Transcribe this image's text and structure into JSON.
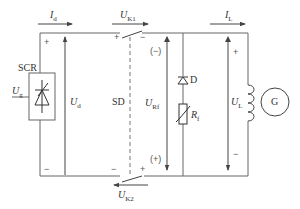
{
  "diagram": {
    "type": "circuit",
    "components": {
      "scr": {
        "label": "SCR",
        "control_voltage": "U",
        "control_voltage_sub": "g"
      },
      "switch_k1": {
        "voltage": "U",
        "voltage_sub": "K1"
      },
      "switch_k2": {
        "voltage": "U",
        "voltage_sub": "K2"
      },
      "switch_device": {
        "label": "SD"
      },
      "diode": {
        "label": "D"
      },
      "resistor": {
        "label": "R",
        "label_sub": "f"
      },
      "generator": {
        "label": "G"
      }
    },
    "currents": {
      "id": {
        "sym": "I",
        "sub": "d"
      },
      "il": {
        "sym": "I",
        "sub": "L"
      }
    },
    "voltages": {
      "ud": {
        "sym": "U",
        "sub": "d"
      },
      "urf": {
        "sym": "U",
        "sub": "Rf"
      },
      "ul": {
        "sym": "U",
        "sub": "L"
      }
    },
    "polarity": {
      "plus": "+",
      "minus": "−",
      "paren_minus": "(−)",
      "paren_plus": "(+)"
    },
    "colors": {
      "line": "#555555",
      "text": "#333333"
    }
  }
}
